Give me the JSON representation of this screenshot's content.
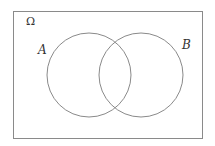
{
  "diagram": {
    "type": "venn",
    "universe_label": "Ω",
    "sets": [
      {
        "label": "A"
      },
      {
        "label": "B"
      }
    ],
    "colors": {
      "stroke": "#8a8a8a",
      "text": "#333333",
      "background": "#ffffff"
    }
  }
}
